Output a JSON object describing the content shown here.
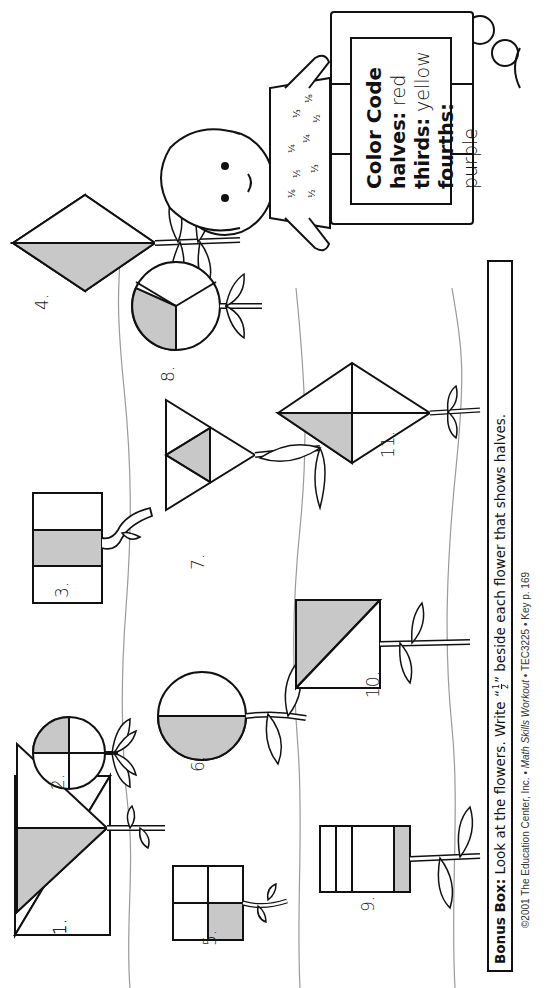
{
  "worksheet": {
    "orientation": "rotated-90-ccw",
    "shade_color": "#c8c8c8",
    "line_color": "#111111",
    "ground_line_color": "#9a9a9a"
  },
  "flowers": [
    {
      "number": "1.",
      "shape": "triangle",
      "parts": 2,
      "shaded": 1,
      "fraction": "halves"
    },
    {
      "number": "2.",
      "shape": "circle",
      "parts": 4,
      "shaded": 1,
      "fraction": "fourths"
    },
    {
      "number": "3.",
      "shape": "rectangle",
      "parts": 3,
      "shaded": 1,
      "fraction": "thirds"
    },
    {
      "number": "4.",
      "shape": "kite",
      "parts": 2,
      "shaded": 1,
      "fraction": "halves"
    },
    {
      "number": "5.",
      "shape": "square",
      "parts": 4,
      "shaded": 1,
      "fraction": "fourths"
    },
    {
      "number": "6.",
      "shape": "circle",
      "parts": 2,
      "shaded": 1,
      "fraction": "halves"
    },
    {
      "number": "7.",
      "shape": "triangle",
      "parts": 4,
      "shaded": 1,
      "fraction": "fourths"
    },
    {
      "number": "8.",
      "shape": "circle",
      "parts": 3,
      "shaded": 1,
      "fraction": "thirds"
    },
    {
      "number": "9.",
      "shape": "rectangle",
      "parts": 4,
      "shaded": 1,
      "fraction": "fourths"
    },
    {
      "number": "10.",
      "shape": "square",
      "parts": 2,
      "shaded": 1,
      "fraction": "halves"
    },
    {
      "number": "11.",
      "shape": "kite",
      "parts": 4,
      "shaded": 1,
      "fraction": "fourths"
    }
  ],
  "color_code": {
    "title": "Color Code",
    "rows": [
      {
        "label": "halves:",
        "value": "red"
      },
      {
        "label": "thirds:",
        "value": "yellow"
      },
      {
        "label": "fourths:",
        "value": "purple"
      }
    ]
  },
  "girl_shirt_fractions": [
    "1/6",
    "1/5",
    "1/4",
    "1/2",
    "1/3",
    "1/4",
    "1/3",
    "1/2",
    "1/8"
  ],
  "bonus_box": {
    "label": "Bonus Box:",
    "text_before": " Look at the flowers. Write “",
    "fraction_numerator": "1",
    "fraction_denominator": "2",
    "text_after": "” beside each flower that shows halves."
  },
  "footer": {
    "copyright": "©2001 The Education Center, Inc. • ",
    "book_title": "Math Skills Workout",
    "rest": " • TEC3225 • Key p. 169"
  }
}
